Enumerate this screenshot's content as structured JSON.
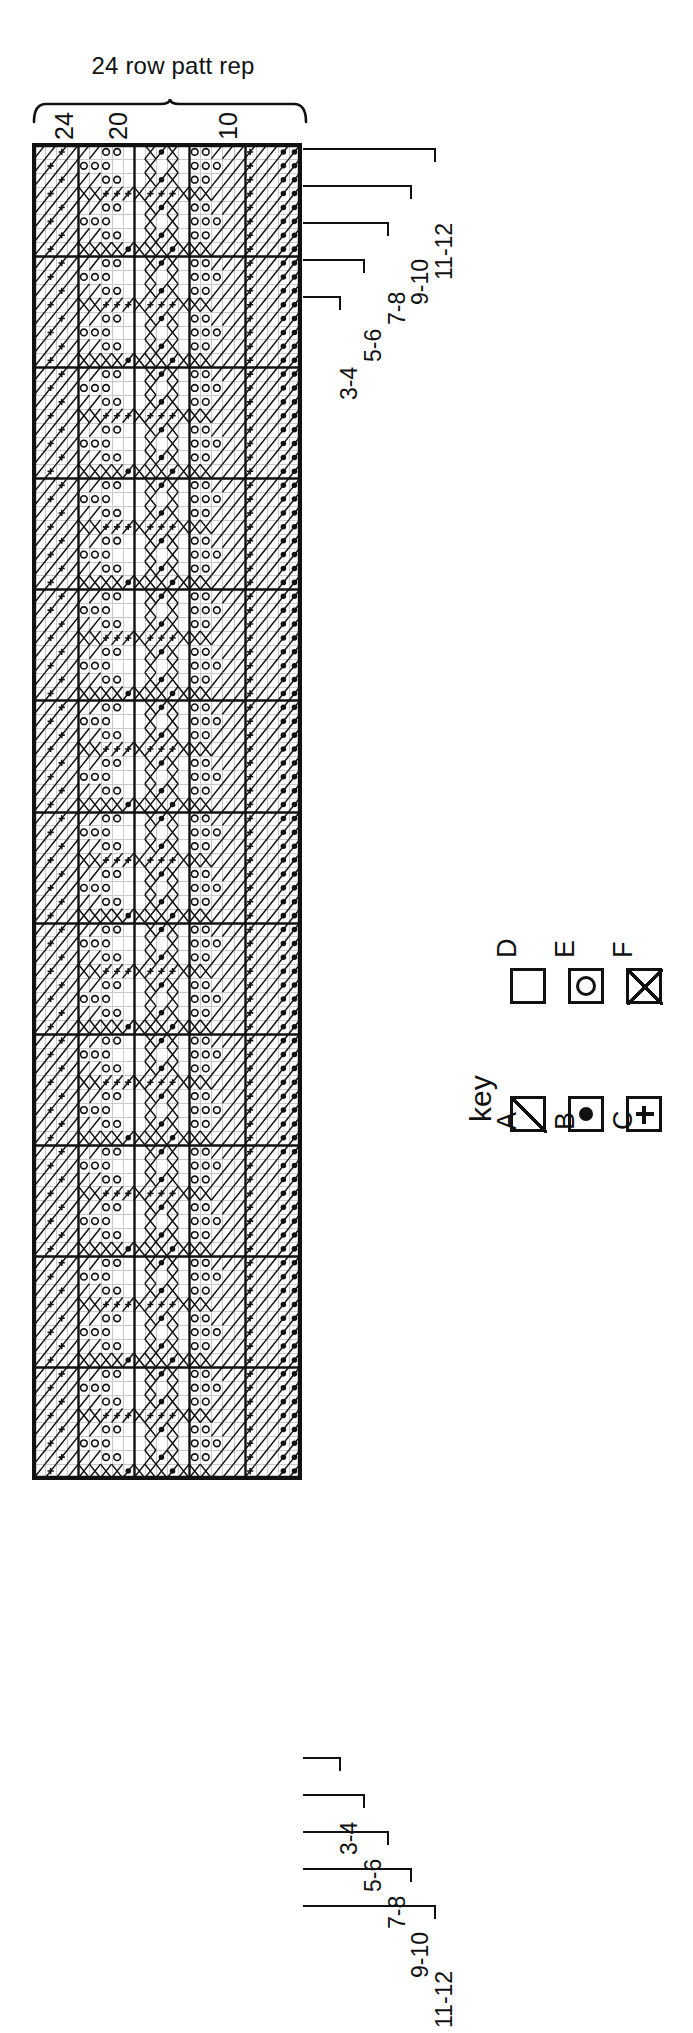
{
  "figure": {
    "type": "knitting-stitch-chart",
    "orientation": "rotated-90-ccw",
    "caption": "24 row patt rep"
  },
  "repeat": {
    "label": "24 row patt rep",
    "rows": 24
  },
  "column_numbers": [
    "24",
    "20",
    "10"
  ],
  "row_labels_top": [
    "11-12",
    "9-10",
    "7-8",
    "5-6",
    "3-4"
  ],
  "row_labels_bottom": [
    "3-4",
    "5-6",
    "7-8",
    "9-10",
    "11-12"
  ],
  "key": {
    "title": "key",
    "entries": [
      {
        "id": "A",
        "symbol": "diagonal-line-box",
        "glyph": "diag"
      },
      {
        "id": "B",
        "symbol": "filled-dot-box",
        "glyph": "dot"
      },
      {
        "id": "C",
        "symbol": "plus-box",
        "glyph": "plus"
      },
      {
        "id": "D",
        "symbol": "empty-box",
        "glyph": "empty"
      },
      {
        "id": "E",
        "symbol": "open-circle-box",
        "glyph": "circle"
      },
      {
        "id": "F",
        "symbol": "cross-box",
        "glyph": "x"
      }
    ]
  },
  "chart_data": {
    "type": "heatmap",
    "title": "24 row patt rep",
    "xlabel": "",
    "ylabel": "",
    "cols": 24,
    "rows": 96,
    "cell_px": 11.1,
    "symbols": {
      "A": "diagonal-line",
      "B": "filled-dot",
      "C": "plus",
      "D": "blank",
      "E": "open-circle",
      "F": "cross"
    },
    "bold_col_lines": [
      0,
      4,
      9,
      14,
      19,
      24
    ],
    "bold_row_every": 8,
    "colors": {
      "ink": "#111111",
      "grid": "#c9c9c9",
      "paper": "#ffffff"
    },
    "block_pattern": [
      "AACAAAEEDDFBFDEEAAACAABB",
      "ACAAEEEDDDFDFDEEEAACAABB",
      "AACAAAEEDDFBFDEEAAACAABB",
      "ACAAFFCCCFCCCFFFAAACAABB",
      "AACAAAEEDDFBFDEEAAACAABB",
      "ACAAEEEDDDFDFDEEEAACAABB",
      "AACAAAEEDDFBFDEEAAACAABB",
      "ACAAFFFFBFFFBFFFAAACAABB"
    ],
    "legend_position": "below-right",
    "grid": true
  }
}
